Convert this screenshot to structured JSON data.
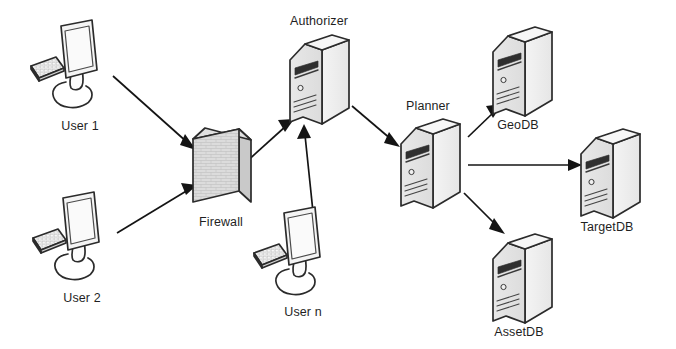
{
  "diagram": {
    "background_color": "#ffffff",
    "line_color": "#141414",
    "outline_color": "#2b2b2b",
    "fill_light": "#f2f2f2",
    "fill_mid": "#e2e2e2",
    "fill_dark": "#d2d2d2",
    "canvas": {
      "width": 676,
      "height": 349
    },
    "nodes": [
      {
        "id": "user1",
        "label": "User 1",
        "type": "workstation-icon",
        "label_x": 80,
        "label_y": 130,
        "x": 55,
        "y": 18
      },
      {
        "id": "user2",
        "label": "User 2",
        "type": "workstation-icon",
        "label_x": 82,
        "label_y": 302,
        "x": 57,
        "y": 190
      },
      {
        "id": "usern",
        "label": "User n",
        "type": "workstation-icon",
        "label_x": 303,
        "label_y": 316,
        "x": 278,
        "y": 205
      },
      {
        "id": "firewall",
        "label": "Firewall",
        "type": "firewall-brick-wall-icon",
        "label_x": 221,
        "label_y": 226,
        "x": 190,
        "y": 118
      },
      {
        "id": "authorizer",
        "label": "Authorizer",
        "type": "server-tower-icon",
        "label_x": 319,
        "label_y": 25,
        "x": 276,
        "y": 42
      },
      {
        "id": "planner",
        "label": "Planner",
        "type": "server-tower-icon",
        "label_x": 428,
        "label_y": 110,
        "x": 392,
        "y": 118
      },
      {
        "id": "geodb",
        "label": "GeoDB",
        "type": "server-tower-icon",
        "label_x": 518,
        "label_y": 129,
        "x": 485,
        "y": 26
      },
      {
        "id": "targetdb",
        "label": "TargetDB",
        "type": "server-tower-icon",
        "label_x": 607,
        "label_y": 231,
        "x": 572,
        "y": 131
      },
      {
        "id": "assetdb",
        "label": "AssetDB",
        "type": "server-tower-icon",
        "label_x": 519,
        "label_y": 336,
        "x": 485,
        "y": 229
      }
    ],
    "edges": [
      {
        "id": "e1",
        "from": "user1",
        "to": "firewall",
        "style": "solid-arrow",
        "direction": "down-right"
      },
      {
        "id": "e2",
        "from": "user2",
        "to": "firewall",
        "style": "solid-arrow",
        "direction": "up-right"
      },
      {
        "id": "e3",
        "from": "firewall",
        "to": "authorizer",
        "style": "solid-arrow",
        "direction": "up-right"
      },
      {
        "id": "e4",
        "from": "usern",
        "to": "authorizer",
        "style": "solid-arrow",
        "direction": "up"
      },
      {
        "id": "e5",
        "from": "authorizer",
        "to": "planner",
        "style": "solid-arrow",
        "direction": "down-right"
      },
      {
        "id": "e6",
        "from": "planner",
        "to": "geodb",
        "style": "solid-arrow",
        "direction": "up-right"
      },
      {
        "id": "e7",
        "from": "planner",
        "to": "targetdb",
        "style": "solid-arrow",
        "direction": "right"
      },
      {
        "id": "e8",
        "from": "planner",
        "to": "assetdb",
        "style": "solid-arrow",
        "direction": "down-right"
      }
    ]
  }
}
